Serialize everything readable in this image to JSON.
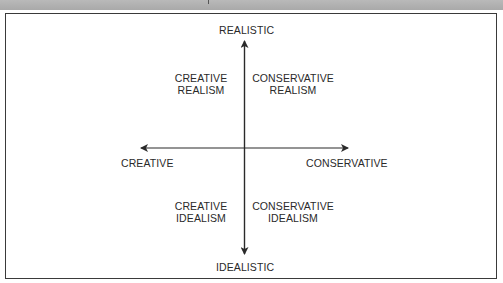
{
  "diagram": {
    "type": "quadrant",
    "axes": {
      "top": "REALISTIC",
      "bottom": "IDEALISTIC",
      "left": "CREATIVE",
      "right": "CONSERVATIVE"
    },
    "quadrants": {
      "top_left": {
        "line1": "CREATIVE",
        "line2": "REALISM"
      },
      "top_right": {
        "line1": "CONSERVATIVE",
        "line2": "REALISM"
      },
      "bottom_left": {
        "line1": "CREATIVE",
        "line2": "IDEALISM"
      },
      "bottom_right": {
        "line1": "CONSERVATIVE",
        "line2": "IDEALISM"
      }
    },
    "colors": {
      "line": "#2a2a2a",
      "header_bar": "#b0b0b0",
      "background": "#ffffff"
    }
  }
}
